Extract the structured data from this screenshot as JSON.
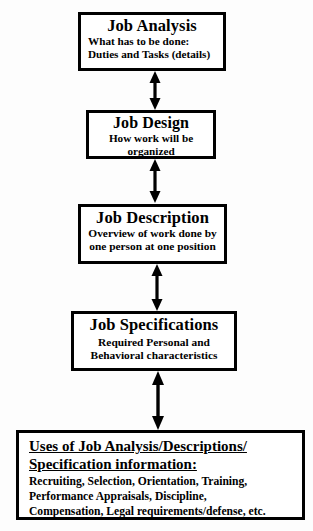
{
  "diagram": {
    "background_color": "#fdfdfd",
    "line_color": "#000000",
    "nodes": [
      {
        "id": "job-analysis",
        "title": "Job Analysis",
        "lines": [
          "What has to be done:",
          "Duties and Tasks (details)"
        ]
      },
      {
        "id": "job-design",
        "title": "Job Design",
        "lines": [
          "How work will be",
          "organized"
        ]
      },
      {
        "id": "job-description",
        "title": "Job Description",
        "lines": [
          "Overview of work done by",
          "one person at one position"
        ]
      },
      {
        "id": "job-specifications",
        "title": "Job Specifications",
        "lines": [
          "Required Personal and",
          "Behavioral characteristics"
        ]
      },
      {
        "id": "uses",
        "heading_lines": [
          "Uses of Job Analysis/Descriptions/",
          "Specification information:"
        ],
        "lines": [
          "Recruiting,  Selection, Orientation,  Training,",
          "Performance Appraisals,  Discipline,",
          "Compensation,  Legal requirements/defense, etc."
        ]
      }
    ],
    "connectors": [
      {
        "id": "arrow-analysis-design",
        "type": "double-headed-vertical",
        "from": "job-analysis",
        "to": "job-design"
      },
      {
        "id": "arrow-design-description",
        "type": "double-headed-vertical",
        "from": "job-design",
        "to": "job-description"
      },
      {
        "id": "arrow-description-specifications",
        "type": "double-headed-vertical",
        "from": "job-description",
        "to": "job-specifications"
      },
      {
        "id": "arrow-specifications-uses",
        "type": "double-headed-vertical",
        "from": "job-specifications",
        "to": "uses"
      }
    ]
  }
}
